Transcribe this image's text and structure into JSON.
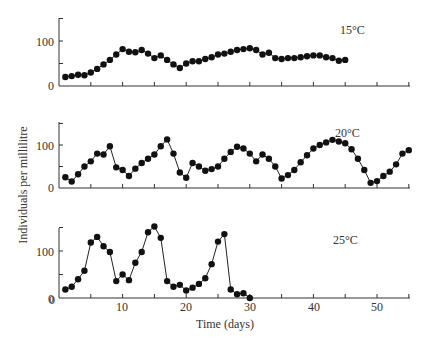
{
  "chart_data": {
    "type": "line",
    "title": "",
    "xlabel": "Time (days)",
    "ylabel": "Individuals per millilitre",
    "xlim": [
      0,
      55
    ],
    "x_ticks": [
      0,
      10,
      20,
      30,
      40,
      50
    ],
    "grid": false,
    "legend": "none",
    "panels": [
      {
        "label": "15°C",
        "ylim": [
          0,
          150
        ],
        "y_ticks": [
          0,
          100
        ],
        "x": [
          1,
          2,
          3,
          4,
          5,
          6,
          7,
          8,
          9,
          10,
          11,
          12,
          13,
          14,
          15,
          16,
          17,
          18,
          19,
          20,
          21,
          22,
          23,
          24,
          25,
          26,
          27,
          28,
          29,
          30,
          31,
          32,
          33,
          34,
          35,
          36,
          37,
          38,
          39,
          40,
          41,
          42,
          43,
          44,
          45
        ],
        "values": [
          20,
          22,
          25,
          24,
          30,
          38,
          48,
          58,
          70,
          82,
          76,
          75,
          80,
          72,
          62,
          68,
          58,
          48,
          40,
          50,
          55,
          55,
          60,
          64,
          70,
          72,
          76,
          80,
          82,
          84,
          80,
          70,
          74,
          62,
          60,
          62,
          62,
          64,
          66,
          68,
          68,
          64,
          62,
          56,
          58,
          62,
          66,
          72
        ]
      },
      {
        "label": "20°C",
        "ylim": [
          0,
          150
        ],
        "y_ticks": [
          0,
          100
        ],
        "x": [
          1,
          2,
          3,
          4,
          5,
          6,
          7,
          8,
          9,
          10,
          11,
          12,
          13,
          14,
          15,
          16,
          17,
          18,
          19,
          20,
          21,
          22,
          23,
          24,
          25,
          26,
          27,
          28,
          29,
          30,
          31,
          32,
          33,
          34,
          35,
          36,
          37,
          38,
          39,
          40,
          41,
          42,
          43,
          44,
          45,
          46,
          47,
          48,
          49,
          50,
          51,
          52,
          53,
          54,
          55
        ],
        "values": [
          25,
          15,
          32,
          50,
          62,
          80,
          78,
          97,
          48,
          42,
          28,
          45,
          58,
          68,
          78,
          97,
          113,
          80,
          36,
          24,
          58,
          50,
          40,
          44,
          50,
          68,
          84,
          96,
          92,
          80,
          62,
          78,
          68,
          50,
          22,
          30,
          42,
          60,
          76,
          92,
          100,
          106,
          112,
          108,
          104,
          90,
          68,
          42,
          12,
          16,
          28,
          38,
          55,
          80,
          88
        ]
      },
      {
        "label": "25°C",
        "ylim": [
          0,
          150
        ],
        "y_ticks": [
          0,
          100
        ],
        "x": [
          1,
          2,
          3,
          4,
          5,
          6,
          7,
          8,
          9,
          10,
          11,
          12,
          13,
          14,
          15,
          16,
          17,
          18,
          19,
          20,
          21,
          22,
          23,
          24,
          25,
          26,
          27,
          28,
          29,
          30
        ],
        "values": [
          18,
          24,
          40,
          58,
          118,
          130,
          110,
          98,
          36,
          50,
          38,
          75,
          98,
          140,
          152,
          128,
          36,
          24,
          28,
          16,
          22,
          30,
          42,
          72,
          120,
          136,
          18,
          8,
          10,
          0
        ]
      }
    ]
  },
  "labels": {
    "ylabel": "Individuals per millilitre",
    "xlabel": "Time (days)",
    "panel1": "15°C",
    "panel2": "20°C",
    "panel3": "25°C",
    "y0": "0",
    "y100": "100",
    "x0": "0",
    "x10": "10",
    "x20": "20",
    "x30": "30",
    "x40": "40",
    "x50": "50"
  }
}
